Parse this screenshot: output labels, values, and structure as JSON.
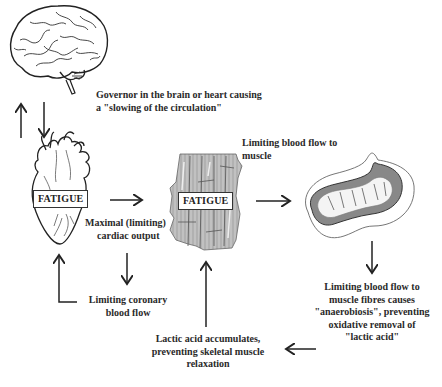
{
  "nodes": {
    "brain": {
      "icon": "brain-icon"
    },
    "heart": {
      "icon": "heart-icon",
      "label": "FATIGUE"
    },
    "muscle": {
      "icon": "muscle-fibre-icon",
      "label": "FATIGUE"
    },
    "mitochondrion": {
      "icon": "mitochondrion-icon"
    }
  },
  "labels": {
    "governor": [
      "Governor in the brain or heart causing",
      "a \"slowing of the circulation\""
    ],
    "cardiac_output": [
      "Maximal (limiting)",
      "cardiac output"
    ],
    "coronary_flow": [
      "Limiting coronary",
      "blood flow"
    ],
    "muscle_flow": [
      "Limiting blood flow to",
      "muscle"
    ],
    "anaerobiosis": [
      "Limiting blood flow to",
      "muscle fibres causes",
      "\"anaerobiosis\", preventing",
      "oxidative removal of",
      "\"lactic acid\""
    ],
    "lactic_acid": [
      "Lactic acid accumulates,",
      "preventing skeletal muscle",
      "relaxation"
    ]
  },
  "colors": {
    "line": "#222222",
    "text": "#2a2a2a",
    "background": "#ffffff"
  }
}
